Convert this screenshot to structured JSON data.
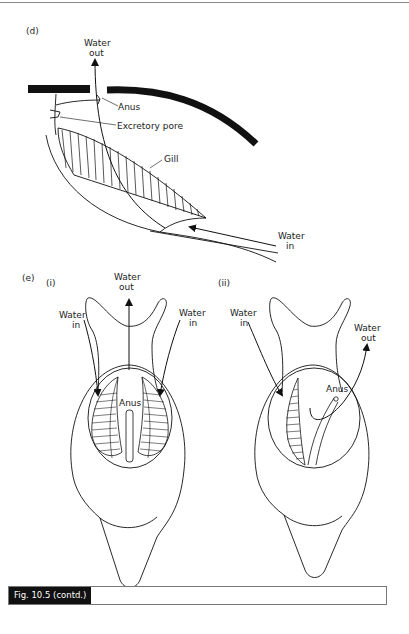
{
  "figure": {
    "caption": "Fig. 10.5  (contd.)",
    "panel_d": {
      "label": "(d)",
      "water_out": [
        "Water",
        "out"
      ],
      "water_in": [
        "Water",
        "in"
      ],
      "anus": "Anus",
      "excretory_pore": "Excretory pore",
      "gill": "Gill"
    },
    "panel_e": {
      "label": "(e)",
      "sub_i": {
        "label": "(i)",
        "water_out": [
          "Water",
          "out"
        ],
        "water_in_left": [
          "Water",
          "in"
        ],
        "water_in_right": [
          "Water",
          "in"
        ],
        "anus": "Anus"
      },
      "sub_ii": {
        "label": "(ii)",
        "water_in": [
          "Water",
          "in"
        ],
        "water_out": [
          "Water",
          "out"
        ],
        "anus": "Anus"
      }
    }
  }
}
